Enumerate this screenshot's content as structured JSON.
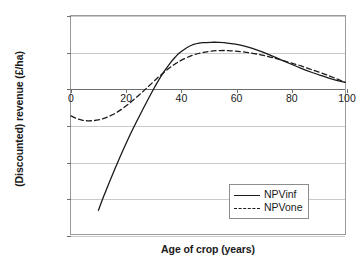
{
  "chart_data": {
    "type": "line",
    "title": "",
    "xlabel": "Age of crop (years)",
    "ylabel": "(Discounted) revenue (£/ha)",
    "xlim": [
      0,
      100
    ],
    "ylim": [
      -8000,
      4000
    ],
    "xticks": [
      0,
      20,
      40,
      60,
      80,
      100
    ],
    "yticks": [
      4000,
      2000,
      0,
      -2000,
      -4000,
      -6000,
      -8000
    ],
    "ytick_labels": [
      "4000",
      "2000",
      "0",
      "–2000",
      "–4000",
      "–6000",
      "–8000"
    ],
    "xtick_labels": [
      "0",
      "20",
      "40",
      "60",
      "80",
      "100"
    ],
    "grid": "horizontal",
    "legend_position": "bottom-right",
    "series": [
      {
        "name": "NPVinf",
        "style": "solid",
        "color": "#1a1a1a",
        "x": [
          10,
          12,
          14,
          16,
          18,
          20,
          22,
          24,
          26,
          28,
          30,
          32,
          34,
          36,
          38,
          40,
          44,
          48,
          52,
          54,
          56,
          60,
          64,
          68,
          72,
          76,
          80,
          84,
          88,
          92,
          96,
          100
        ],
        "y": [
          -6700,
          -5900,
          -5150,
          -4420,
          -3720,
          -3050,
          -2400,
          -1790,
          -1200,
          -620,
          -60,
          470,
          950,
          1370,
          1730,
          2020,
          2390,
          2530,
          2555,
          2550,
          2530,
          2450,
          2310,
          2120,
          1890,
          1630,
          1370,
          1120,
          890,
          690,
          500,
          350
        ]
      },
      {
        "name": "NPVone",
        "style": "dashed",
        "color": "#1a1a1a",
        "x": [
          0,
          2,
          4,
          6,
          8,
          10,
          12,
          14,
          16,
          18,
          20,
          22,
          24,
          26,
          28,
          30,
          32,
          34,
          36,
          38,
          40,
          44,
          48,
          52,
          56,
          57,
          60,
          64,
          68,
          72,
          76,
          80,
          84,
          88,
          92,
          96,
          100
        ],
        "y": [
          -1500,
          -1640,
          -1730,
          -1770,
          -1760,
          -1720,
          -1640,
          -1520,
          -1370,
          -1180,
          -960,
          -720,
          -460,
          -190,
          90,
          370,
          650,
          910,
          1150,
          1360,
          1540,
          1820,
          1990,
          2080,
          2100,
          2100,
          2070,
          2000,
          1900,
          1770,
          1610,
          1430,
          1250,
          1040,
          830,
          600,
          350
        ]
      }
    ]
  },
  "legend": {
    "entries": [
      {
        "label": "NPVinf",
        "style": "solid"
      },
      {
        "label": "NPVone",
        "style": "dashed"
      }
    ]
  }
}
